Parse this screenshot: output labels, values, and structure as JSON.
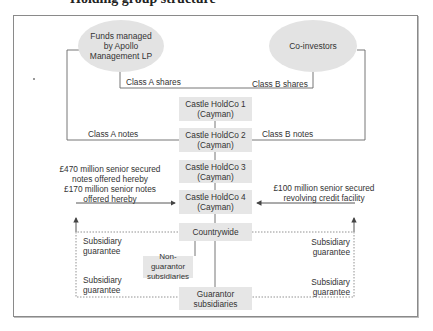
{
  "title": "Holding group structure",
  "entities": {
    "apollo": "Funds managed\nby Apollo\nManagement LP",
    "coinvestors": "Co-investors",
    "holdco1": "Castle HoldCo 1\n(Cayman)",
    "holdco2": "Castle HoldCo 2\n(Cayman)",
    "holdco3": "Castle HoldCo 3\n(Cayman)",
    "holdco4": "Castle HoldCo 4\n(Cayman)",
    "countrywide": "Countrywide",
    "non_guarantor": "Non-guarantor\nsubsidiaries",
    "guarantor": "Guarantor\nsubsidiaries"
  },
  "labels": {
    "class_a_shares": "Class A shares",
    "class_b_shares": "Class B shares",
    "class_a_notes": "Class A notes",
    "class_b_notes": "Class B notes",
    "senior_notes": "£470 million senior secured\nnotes offered hereby\n£170 million senior notes\noffered hereby",
    "revolving_facility": "£100 million senior secured\nrevolving credit facility",
    "sub_guarantee_left_top": "Subsidiary\nguarantee",
    "sub_guarantee_left_bottom": "Subsidiary\nguarantee",
    "sub_guarantee_right_top": "Subsidiary\nguarantee",
    "sub_guarantee_right_bottom": "Subsidiary\nguarantee"
  },
  "colors": {
    "box_fill": "#e6e6e6",
    "ellipse_fill": "#e3e3e3",
    "line": "#555555",
    "frame": "#8a8a8a"
  }
}
